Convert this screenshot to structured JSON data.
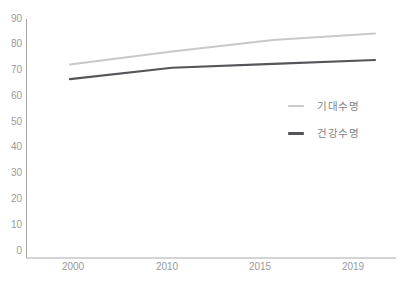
{
  "chart_data": {
    "type": "line",
    "categories": [
      "2000",
      "2010",
      "2015",
      "2019"
    ],
    "series": [
      {
        "id": "life-expectancy",
        "name": "기대수명",
        "values": [
          72,
          77,
          81.5,
          84
        ],
        "color": "#c9c9c9"
      },
      {
        "id": "healthy-life-expectancy",
        "name": "건강수명",
        "values": [
          66.3,
          70.7,
          72.2,
          73.7
        ],
        "color": "#56565a"
      }
    ],
    "title": "",
    "xlabel": "",
    "ylabel": "",
    "y_ticks": [
      0,
      10,
      20,
      30,
      40,
      50,
      60,
      70,
      80,
      90
    ],
    "ylim": [
      0,
      90
    ],
    "grid": false,
    "legend_position": "right-middle"
  },
  "colors": {
    "background": "#ffffff",
    "axis": "#a9a9a9",
    "tick_label": "#9a9a9a",
    "legend_label": "#828282"
  }
}
